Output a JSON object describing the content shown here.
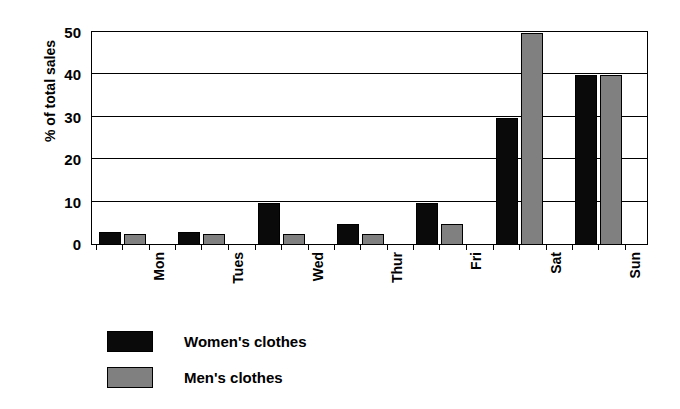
{
  "chart_data": {
    "type": "bar",
    "title": "",
    "xlabel": "",
    "ylabel": "% of total sales",
    "ylim": [
      0,
      50
    ],
    "yticks": [
      0,
      10,
      20,
      30,
      40,
      50
    ],
    "ytick_labels": [
      "0",
      "10",
      "20",
      "30",
      "40",
      "50"
    ],
    "grid": true,
    "grid_axis": "y",
    "legend_position": "below-plot-left",
    "categories": [
      "Mon",
      "Tues",
      "Wed",
      "Thur",
      "Fri",
      "Sat",
      "Sun"
    ],
    "series": [
      {
        "name": "Women's clothes",
        "color": "#0a0a0a",
        "values": [
          3,
          3,
          10,
          5,
          10,
          30,
          40
        ]
      },
      {
        "name": "Men's clothes",
        "color": "#808080",
        "values": [
          2.5,
          2.5,
          2.5,
          2.5,
          5,
          50,
          40
        ]
      }
    ]
  },
  "legend": {
    "items": [
      {
        "label": "Women's clothes",
        "swatch": "black-swatch-icon"
      },
      {
        "label": "Men's clothes",
        "swatch": "gray-swatch-icon"
      }
    ]
  },
  "colors": {
    "women": "#0a0a0a",
    "men": "#808080",
    "axis": "#000000",
    "background": "#ffffff"
  }
}
